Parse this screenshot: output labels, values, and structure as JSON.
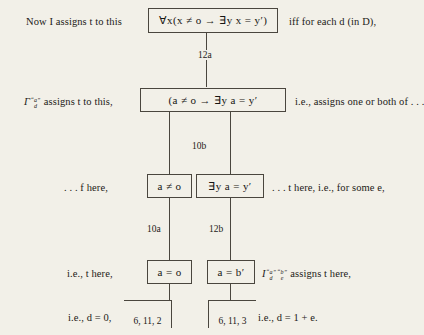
{
  "page": {
    "background_color": "#f2f0e8",
    "ink_color": "#1c1a17",
    "type": "logic-derivation-tree"
  },
  "rows": {
    "row1": {
      "left_text": "Now I assigns t to this",
      "box_text": "∀x(x ≠ o → ∃y x = y′)",
      "right_text": "iff for each d (in D),"
    },
    "row2": {
      "left_gamma": "Γ",
      "left_sup": "“a”",
      "left_sub": "d",
      "left_text": "assigns t to this,",
      "box_text": "(a ≠ o → ∃y a = y′",
      "right_text": "i.e., assigns one or both of . . ."
    },
    "row3": {
      "left_text": ". . . f here,",
      "box_left_text": "a ≠ o",
      "box_right_text": "∃y a = y′",
      "right_text": ". . . t here, i.e., for some e,"
    },
    "row4": {
      "left_text": "i.e., t here,",
      "box_left_text": "a = o",
      "box_right_text": "a = b′",
      "right_sym": "I",
      "right_sup1": "“a”",
      "right_sub1": "d",
      "right_sup2": "“b”",
      "right_sub2": "e",
      "right_text": "assigns t here,"
    },
    "row5": {
      "left_text": "i.e., d = 0,",
      "box_left_text": "6, 11, 2",
      "box_right_text": "6, 11, 3",
      "right_text": "i.e., d = 1 + e."
    }
  },
  "edges": {
    "e1": "12a",
    "e2": "10b",
    "e3": "10a",
    "e4": "12b"
  }
}
